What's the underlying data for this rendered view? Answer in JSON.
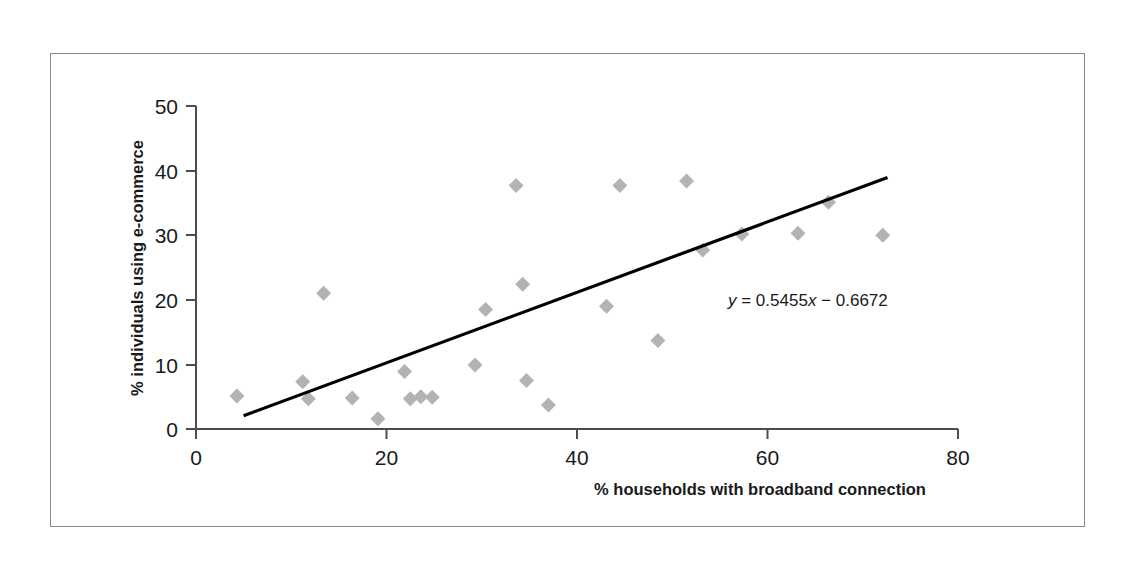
{
  "chart_data": {
    "type": "scatter",
    "title": "",
    "xlabel": "% households with broadband connection",
    "ylabel": "% individuals using e-commerce",
    "xlim": [
      0,
      80
    ],
    "ylim": [
      0,
      50
    ],
    "xticks": [
      0,
      20,
      40,
      60,
      80
    ],
    "yticks": [
      0,
      10,
      20,
      30,
      40,
      50
    ],
    "grid": false,
    "legend": false,
    "marker": "diamond",
    "marker_color": "#b3b3b3",
    "axis_color": "#4d4d4d",
    "trendline_color": "#000000",
    "points": [
      {
        "x": 4.3,
        "y": 5.1
      },
      {
        "x": 11.2,
        "y": 7.3
      },
      {
        "x": 11.8,
        "y": 4.7
      },
      {
        "x": 13.4,
        "y": 21.0
      },
      {
        "x": 16.4,
        "y": 4.8
      },
      {
        "x": 19.1,
        "y": 1.6
      },
      {
        "x": 21.9,
        "y": 8.9
      },
      {
        "x": 22.5,
        "y": 4.7
      },
      {
        "x": 23.6,
        "y": 5.0
      },
      {
        "x": 24.8,
        "y": 4.9
      },
      {
        "x": 29.3,
        "y": 9.9
      },
      {
        "x": 30.4,
        "y": 18.5
      },
      {
        "x": 33.6,
        "y": 37.7
      },
      {
        "x": 34.3,
        "y": 22.4
      },
      {
        "x": 34.7,
        "y": 7.5
      },
      {
        "x": 37.0,
        "y": 3.7
      },
      {
        "x": 43.1,
        "y": 19.0
      },
      {
        "x": 44.5,
        "y": 37.7
      },
      {
        "x": 48.5,
        "y": 13.7
      },
      {
        "x": 51.5,
        "y": 38.4
      },
      {
        "x": 53.2,
        "y": 27.7
      },
      {
        "x": 57.3,
        "y": 30.2
      },
      {
        "x": 63.2,
        "y": 30.3
      },
      {
        "x": 66.4,
        "y": 35.1
      },
      {
        "x": 72.1,
        "y": 30.0
      }
    ],
    "trendline": {
      "equation": "y = 0.5455x − 0.6672",
      "equation_y": "y",
      "equation_rest": " = 0.5455",
      "equation_x": "x",
      "equation_tail": " − 0.6672",
      "slope": 0.5455,
      "intercept": -0.6672,
      "x_start": 5.0,
      "x_end": 72.6
    }
  }
}
